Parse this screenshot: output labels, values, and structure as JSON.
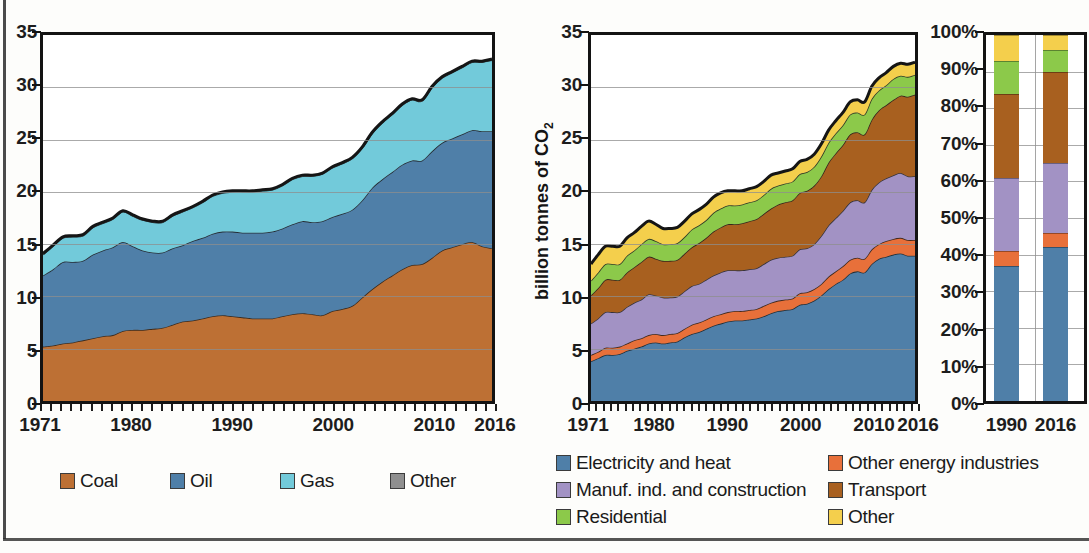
{
  "colors": {
    "coal": "#bd7034",
    "oil": "#4f7fa8",
    "gas": "#72cada",
    "other_fuel": "#8f8f8f",
    "electricity_and_heat": "#4f7fa8",
    "other_energy_industries": "#e8703a",
    "manuf_ind_and_construction": "#a292c4",
    "transport": "#a8601f",
    "residential": "#8cc94a",
    "other_sector": "#f4cf4c",
    "axis": "#131313",
    "grid": "#8e8e8e"
  },
  "left_chart": {
    "ylabel": "",
    "y_ticks": [
      "0",
      "5",
      "10",
      "15",
      "20",
      "25",
      "30",
      "35"
    ],
    "x_ticks": [
      "1971",
      "1980",
      "1990",
      "2000",
      "2010",
      "2016"
    ],
    "legend": [
      {
        "label": "Coal",
        "color_key": "coal"
      },
      {
        "label": "Oil",
        "color_key": "oil"
      },
      {
        "label": "Gas",
        "color_key": "gas"
      },
      {
        "label": "Other",
        "color_key": "other_fuel"
      }
    ]
  },
  "middle_chart": {
    "ylabel_main": "billion tonnes of CO",
    "ylabel_sub": "2",
    "y_ticks": [
      "0",
      "5",
      "10",
      "15",
      "20",
      "25",
      "30",
      "35"
    ],
    "x_ticks": [
      "1971",
      "1980",
      "1990",
      "2000",
      "2010",
      "2016"
    ],
    "legend": [
      {
        "label": "Electricity and heat",
        "color_key": "electricity_and_heat"
      },
      {
        "label": "Other energy industries",
        "color_key": "other_energy_industries"
      },
      {
        "label": "Manuf. ind. and construction",
        "color_key": "manuf_ind_and_construction"
      },
      {
        "label": "Transport",
        "color_key": "transport"
      },
      {
        "label": "Residential",
        "color_key": "residential"
      },
      {
        "label": "Other",
        "color_key": "other_sector"
      }
    ]
  },
  "right_chart": {
    "y_ticks": [
      "0%",
      "10%",
      "20%",
      "30%",
      "40%",
      "50%",
      "60%",
      "70%",
      "80%",
      "90%",
      "100%"
    ],
    "x_ticks": [
      "1990",
      "2016"
    ]
  },
  "chart_data": [
    {
      "id": "world-co2-by-fuel",
      "type": "area",
      "stacked": true,
      "title": "",
      "xlabel": "",
      "ylabel": "billion tonnes of CO2",
      "ylim": [
        0,
        35
      ],
      "xlim": [
        1971,
        2016
      ],
      "grid": true,
      "legend_position": "bottom",
      "x": [
        1971,
        1972,
        1973,
        1974,
        1975,
        1976,
        1977,
        1978,
        1979,
        1980,
        1981,
        1982,
        1983,
        1984,
        1985,
        1986,
        1987,
        1988,
        1989,
        1990,
        1991,
        1992,
        1993,
        1994,
        1995,
        1996,
        1997,
        1998,
        1999,
        2000,
        2001,
        2002,
        2003,
        2004,
        2005,
        2006,
        2007,
        2008,
        2009,
        2010,
        2011,
        2012,
        2013,
        2014,
        2015,
        2016
      ],
      "series": [
        {
          "name": "Coal",
          "color": "#bd7034",
          "values": [
            5.2,
            5.3,
            5.5,
            5.6,
            5.8,
            6.0,
            6.2,
            6.3,
            6.7,
            6.8,
            6.8,
            6.9,
            7.0,
            7.3,
            7.6,
            7.7,
            7.9,
            8.1,
            8.2,
            8.1,
            8.0,
            7.9,
            7.9,
            7.9,
            8.1,
            8.3,
            8.4,
            8.3,
            8.2,
            8.6,
            8.8,
            9.1,
            9.9,
            10.7,
            11.4,
            12.0,
            12.6,
            13.0,
            13.1,
            13.7,
            14.4,
            14.7,
            15.0,
            15.2,
            14.8,
            14.6
          ]
        },
        {
          "name": "Oil",
          "color": "#4f7fa8",
          "values": [
            6.8,
            7.3,
            7.8,
            7.7,
            7.6,
            8.0,
            8.2,
            8.4,
            8.5,
            8.0,
            7.6,
            7.3,
            7.2,
            7.3,
            7.3,
            7.6,
            7.7,
            7.9,
            8.0,
            8.1,
            8.1,
            8.2,
            8.2,
            8.3,
            8.4,
            8.6,
            8.8,
            8.8,
            9.0,
            9.0,
            9.1,
            9.2,
            9.3,
            9.7,
            9.8,
            9.9,
            10.0,
            10.0,
            9.9,
            10.2,
            10.3,
            10.4,
            10.5,
            10.7,
            11.0,
            11.2
          ]
        },
        {
          "name": "Gas",
          "color": "#72cada",
          "values": [
            2.0,
            2.2,
            2.3,
            2.4,
            2.4,
            2.6,
            2.6,
            2.7,
            2.9,
            2.9,
            2.9,
            2.9,
            2.9,
            3.1,
            3.2,
            3.2,
            3.4,
            3.6,
            3.7,
            3.8,
            3.9,
            3.9,
            4.0,
            4.0,
            4.1,
            4.3,
            4.3,
            4.4,
            4.5,
            4.7,
            4.8,
            4.9,
            5.0,
            5.2,
            5.4,
            5.5,
            5.7,
            5.8,
            5.7,
            6.1,
            6.2,
            6.3,
            6.4,
            6.5,
            6.6,
            6.8
          ]
        },
        {
          "name": "Other",
          "color": "#8f8f8f",
          "values": [
            0.1,
            0.1,
            0.1,
            0.1,
            0.1,
            0.1,
            0.1,
            0.1,
            0.1,
            0.1,
            0.1,
            0.1,
            0.1,
            0.1,
            0.1,
            0.1,
            0.1,
            0.1,
            0.1,
            0.1,
            0.1,
            0.1,
            0.1,
            0.1,
            0.1,
            0.1,
            0.1,
            0.1,
            0.1,
            0.1,
            0.1,
            0.1,
            0.1,
            0.1,
            0.1,
            0.1,
            0.1,
            0.1,
            0.1,
            0.1,
            0.1,
            0.1,
            0.1,
            0.1,
            0.1,
            0.1
          ]
        }
      ]
    },
    {
      "id": "world-co2-by-sector",
      "type": "area",
      "stacked": true,
      "title": "",
      "xlabel": "",
      "ylabel": "billion tonnes of CO2",
      "ylim": [
        0,
        35
      ],
      "xlim": [
        1971,
        2016
      ],
      "grid": true,
      "legend_position": "bottom",
      "x": [
        1971,
        1972,
        1973,
        1974,
        1975,
        1976,
        1977,
        1978,
        1979,
        1980,
        1981,
        1982,
        1983,
        1984,
        1985,
        1986,
        1987,
        1988,
        1989,
        1990,
        1991,
        1992,
        1993,
        1994,
        1995,
        1996,
        1997,
        1998,
        1999,
        2000,
        2001,
        2002,
        2003,
        2004,
        2005,
        2006,
        2007,
        2008,
        2009,
        2010,
        2011,
        2012,
        2013,
        2014,
        2015,
        2016
      ],
      "series": [
        {
          "name": "Electricity and heat",
          "color": "#4f7fa8",
          "values": [
            3.8,
            4.1,
            4.4,
            4.4,
            4.5,
            4.8,
            5.0,
            5.2,
            5.5,
            5.6,
            5.5,
            5.6,
            5.7,
            6.1,
            6.4,
            6.6,
            6.9,
            7.2,
            7.4,
            7.6,
            7.7,
            7.7,
            7.8,
            7.9,
            8.1,
            8.4,
            8.6,
            8.7,
            8.8,
            9.2,
            9.3,
            9.6,
            10.1,
            10.7,
            11.2,
            11.6,
            12.2,
            12.4,
            12.3,
            13.1,
            13.6,
            13.8,
            14.0,
            14.1,
            13.9,
            13.9
          ]
        },
        {
          "name": "Other energy industries",
          "color": "#e8703a",
          "values": [
            0.6,
            0.6,
            0.7,
            0.7,
            0.7,
            0.7,
            0.8,
            0.8,
            0.8,
            0.8,
            0.8,
            0.8,
            0.8,
            0.8,
            0.9,
            0.9,
            0.9,
            0.9,
            0.9,
            0.9,
            0.9,
            0.9,
            0.9,
            0.9,
            1.0,
            1.0,
            1.0,
            1.0,
            1.0,
            1.1,
            1.1,
            1.1,
            1.1,
            1.2,
            1.2,
            1.3,
            1.3,
            1.3,
            1.3,
            1.4,
            1.4,
            1.5,
            1.5,
            1.5,
            1.5,
            1.5
          ]
        },
        {
          "name": "Manuf. ind. and construction",
          "color": "#a292c4",
          "values": [
            3.0,
            3.2,
            3.4,
            3.4,
            3.3,
            3.5,
            3.6,
            3.7,
            3.9,
            3.7,
            3.6,
            3.5,
            3.5,
            3.6,
            3.7,
            3.7,
            3.8,
            3.9,
            4.0,
            4.0,
            3.9,
            3.9,
            3.9,
            3.9,
            4.0,
            4.1,
            4.1,
            4.1,
            4.1,
            4.2,
            4.2,
            4.3,
            4.6,
            4.9,
            5.1,
            5.3,
            5.5,
            5.5,
            5.4,
            5.7,
            5.9,
            6.0,
            6.1,
            6.2,
            6.1,
            6.1
          ]
        },
        {
          "name": "Transport",
          "color": "#a8601f",
          "values": [
            2.7,
            2.9,
            3.1,
            3.1,
            3.1,
            3.3,
            3.4,
            3.6,
            3.6,
            3.5,
            3.5,
            3.5,
            3.5,
            3.6,
            3.7,
            3.9,
            4.0,
            4.2,
            4.3,
            4.4,
            4.4,
            4.5,
            4.6,
            4.7,
            4.8,
            4.9,
            5.1,
            5.2,
            5.3,
            5.4,
            5.5,
            5.6,
            5.7,
            6.0,
            6.2,
            6.3,
            6.5,
            6.5,
            6.5,
            6.7,
            6.9,
            7.0,
            7.2,
            7.4,
            7.6,
            7.8
          ]
        },
        {
          "name": "Residential",
          "color": "#8cc94a",
          "values": [
            1.4,
            1.5,
            1.5,
            1.5,
            1.5,
            1.6,
            1.6,
            1.7,
            1.7,
            1.7,
            1.6,
            1.6,
            1.6,
            1.6,
            1.7,
            1.7,
            1.7,
            1.8,
            1.8,
            1.8,
            1.8,
            1.8,
            1.8,
            1.8,
            1.8,
            1.9,
            1.8,
            1.8,
            1.8,
            1.8,
            1.8,
            1.8,
            1.9,
            1.9,
            1.9,
            1.9,
            1.9,
            1.9,
            1.9,
            2.0,
            1.9,
            1.9,
            2.0,
            1.9,
            1.9,
            1.9
          ]
        },
        {
          "name": "Other",
          "color": "#f4cf4c",
          "values": [
            1.6,
            1.7,
            1.7,
            1.7,
            1.7,
            1.7,
            1.7,
            1.7,
            1.7,
            1.6,
            1.5,
            1.5,
            1.5,
            1.5,
            1.5,
            1.5,
            1.5,
            1.5,
            1.5,
            1.4,
            1.4,
            1.3,
            1.3,
            1.3,
            1.3,
            1.3,
            1.2,
            1.2,
            1.2,
            1.2,
            1.2,
            1.2,
            1.2,
            1.2,
            1.2,
            1.2,
            1.2,
            1.2,
            1.2,
            1.2,
            1.2,
            1.2,
            1.2,
            1.2,
            1.2,
            1.2
          ]
        }
      ]
    },
    {
      "id": "sector-share-1990-2016",
      "type": "bar",
      "stacked": true,
      "normalized": true,
      "title": "",
      "xlabel": "",
      "ylabel": "",
      "ylim": [
        0,
        100
      ],
      "grid": true,
      "legend_position": "bottom",
      "categories": [
        "1990",
        "2016"
      ],
      "series": [
        {
          "name": "Electricity and heat",
          "color": "#4f7fa8",
          "values": [
            37,
            42
          ]
        },
        {
          "name": "Other energy industries",
          "color": "#e8703a",
          "values": [
            4,
            4
          ]
        },
        {
          "name": "Manuf. ind. and construction",
          "color": "#a292c4",
          "values": [
            20,
            19
          ]
        },
        {
          "name": "Transport",
          "color": "#a8601f",
          "values": [
            23,
            25
          ]
        },
        {
          "name": "Residential",
          "color": "#8cc94a",
          "values": [
            9,
            6
          ]
        },
        {
          "name": "Other",
          "color": "#f4cf4c",
          "values": [
            7,
            4
          ]
        }
      ]
    }
  ]
}
